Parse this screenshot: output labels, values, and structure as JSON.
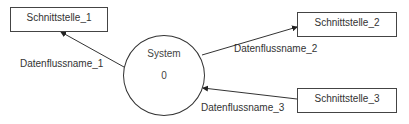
{
  "diagram": {
    "type": "context-diagram",
    "system": {
      "name": "System",
      "number": "0"
    },
    "interfaces": [
      {
        "id": "i1",
        "label": "Schnittstelle_1"
      },
      {
        "id": "i2",
        "label": "Schnittstelle_2"
      },
      {
        "id": "i3",
        "label": "Schnittstelle_3"
      }
    ],
    "flows": [
      {
        "label": "Datenflussname_1",
        "from": "System",
        "to": "Schnittstelle_1"
      },
      {
        "label": "Datenflussname_2",
        "from": "System",
        "to": "Schnittstelle_2"
      },
      {
        "label": "Datenflussname_3",
        "from": "Schnittstelle_3",
        "to": "System"
      }
    ],
    "colors": {
      "stroke": "#333333",
      "text": "#333333",
      "background": "#ffffff"
    }
  }
}
